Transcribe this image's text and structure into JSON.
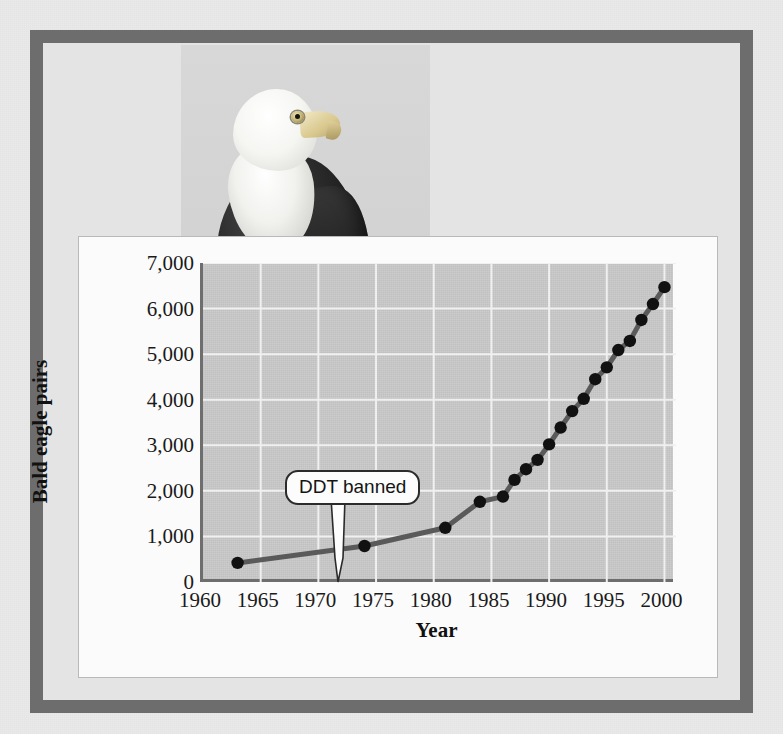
{
  "figure": {
    "photo_caption": "bald-eagle-perched-photo",
    "frame_color": "#6d6d6d",
    "card_color": "#fbfbfb",
    "plot_bg_color": "#c9c9c9",
    "line_color": "#5a5a5a",
    "marker_color": "#111111"
  },
  "annotations": [
    {
      "name": "ddt-banned-callout",
      "text": "DDT banned",
      "year": 1972
    }
  ],
  "chart_data": {
    "type": "line",
    "title": "",
    "xlabel": "Year",
    "ylabel": "Bald eagle pairs",
    "xlim": [
      1960,
      2001
    ],
    "ylim": [
      0,
      7000
    ],
    "xticks": [
      1960,
      1965,
      1970,
      1975,
      1980,
      1985,
      1990,
      1995,
      2000
    ],
    "yticks": [
      0,
      1000,
      2000,
      3000,
      4000,
      5000,
      6000,
      7000
    ],
    "ytick_labels": [
      "0",
      "1,000",
      "2,000",
      "3,000",
      "4,000",
      "5,000",
      "6,000",
      "7,000"
    ],
    "xtick_labels": [
      "1960",
      "1965",
      "1970",
      "1975",
      "1980",
      "1985",
      "1990",
      "1995",
      "2000"
    ],
    "grid": true,
    "legend": null,
    "series": [
      {
        "name": "Bald eagle pairs",
        "x": [
          1963,
          1974,
          1981,
          1984,
          1986,
          1987,
          1988,
          1989,
          1990,
          1991,
          1992,
          1993,
          1994,
          1995,
          1996,
          1997,
          1998,
          1999,
          2000
        ],
        "values": [
          420,
          790,
          1190,
          1760,
          1875,
          2240,
          2475,
          2680,
          3020,
          3390,
          3750,
          4020,
          4450,
          4710,
          5090,
          5290,
          5750,
          6100,
          6470
        ]
      }
    ]
  }
}
